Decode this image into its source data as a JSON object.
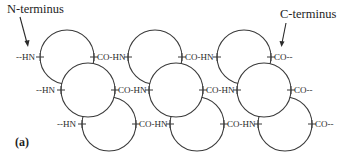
{
  "figure": {
    "panel_label": "(a)",
    "n_terminus_label": "N-terminus",
    "c_terminus_label": "C-terminus",
    "colors": {
      "stroke": "#3a3a3a",
      "background": "#ffffff",
      "text": "#2a2a2a"
    }
  },
  "rows": [
    {
      "labels": [
        "--HN",
        "CO-HN",
        "CO-HN",
        "CO--"
      ]
    },
    {
      "labels": [
        "--HN",
        "CO-HN",
        "CO-HN",
        "CO--"
      ]
    },
    {
      "labels": [
        "--HN",
        "CO-HN",
        "CO-HN",
        "CO--"
      ]
    }
  ]
}
